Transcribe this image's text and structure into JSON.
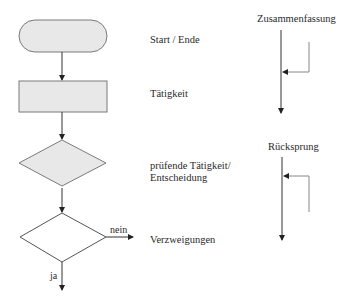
{
  "legend": {
    "items": [
      {
        "shape": "terminal",
        "label": "Start / Ende"
      },
      {
        "shape": "process",
        "label": "Tätigkeit"
      },
      {
        "shape": "decision",
        "label_line1": "prüfende Tätigkeit/",
        "label_line2": "Entscheidung"
      },
      {
        "shape": "branch",
        "label": "Verzweigungen",
        "no_label": "nein",
        "yes_label": "ja"
      }
    ]
  },
  "connectors": {
    "merge": {
      "label": "Zusammenfassung"
    },
    "loopback": {
      "label": "Rücksprung"
    }
  },
  "colors": {
    "fill_gray": "#e8e8e8",
    "stroke": "#7a7a7a",
    "line": "#333333",
    "branch_line": "#888888"
  }
}
